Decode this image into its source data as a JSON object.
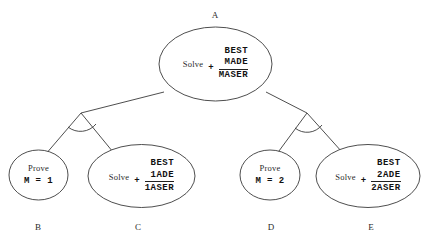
{
  "diagram": {
    "type": "and-or-search-tree",
    "background_color": "#ffffff",
    "stroke_color": "#3a3a3a",
    "nodes": [
      {
        "id": "A",
        "label": "A",
        "label_position": "above",
        "kind": "sum-node",
        "operation": "Solve",
        "plus": "+",
        "addend1": "BEST",
        "addend2": "MADE",
        "total": "MASER"
      },
      {
        "id": "B",
        "label": "B",
        "label_position": "below",
        "kind": "simple-node",
        "operation": "Prove",
        "statement": "M = 1"
      },
      {
        "id": "C",
        "label": "C",
        "label_position": "below",
        "kind": "sum-node",
        "operation": "Solve",
        "plus": "+",
        "addend1": "BEST",
        "addend2": "1ADE",
        "total": "1ASER"
      },
      {
        "id": "D",
        "label": "D",
        "label_position": "below",
        "kind": "simple-node",
        "operation": "Prove",
        "statement": "M = 2"
      },
      {
        "id": "E",
        "label": "E",
        "label_position": "below",
        "kind": "sum-node",
        "operation": "Solve",
        "plus": "+",
        "addend1": "BEST",
        "addend2": "2ADE",
        "total": "2ASER"
      }
    ],
    "edges": [
      {
        "from": "A",
        "to": "junction-left"
      },
      {
        "from": "junction-left",
        "to": "B"
      },
      {
        "from": "junction-left",
        "to": "C"
      },
      {
        "from": "A",
        "to": "junction-right"
      },
      {
        "from": "junction-right",
        "to": "D"
      },
      {
        "from": "junction-right",
        "to": "E"
      }
    ],
    "connectors": [
      {
        "id": "and-arc-left",
        "kind": "and-arc",
        "at": "junction-left"
      },
      {
        "id": "and-arc-right",
        "kind": "and-arc",
        "at": "junction-right"
      }
    ]
  }
}
